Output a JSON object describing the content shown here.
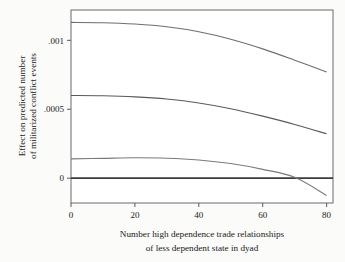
{
  "chart_data": {
    "type": "line",
    "title": "",
    "subtitle": "",
    "xlabel_line1": "Number high dependence trade relationships",
    "xlabel_line2": "of less dependent state in dyad",
    "ylabel_line1": "Effect on predicted number",
    "ylabel_line2": "of militarized conflict events",
    "xlim": [
      0,
      82
    ],
    "ylim": [
      -0.00018,
      0.00122
    ],
    "grid": false,
    "legend": false,
    "legend_position": "none",
    "xticks": [
      0,
      20,
      40,
      60,
      80
    ],
    "xticklabels": [
      "0",
      "20",
      "40",
      "60",
      "80"
    ],
    "yticks": [
      0,
      0.0005,
      0.001
    ],
    "yticklabels": [
      "0",
      ".0005",
      ".001"
    ],
    "reference_lines": [
      {
        "name": "zero-line",
        "orientation": "horizontal",
        "value": 0,
        "color": "#3b3b3b",
        "width": 1.8
      }
    ],
    "x": [
      0,
      10,
      20,
      30,
      40,
      50,
      60,
      70,
      80
    ],
    "series": [
      {
        "name": "upper-curve",
        "color": "#6e6e6e",
        "values": [
          0.00113,
          0.001128,
          0.001118,
          0.001098,
          0.001062,
          0.001008,
          0.000938,
          0.000856,
          0.00077
        ]
      },
      {
        "name": "middle-curve",
        "color": "#5a5a5a",
        "values": [
          0.0006,
          0.000598,
          0.00059,
          0.000574,
          0.000546,
          0.000504,
          0.00045,
          0.00039,
          0.000322
        ]
      },
      {
        "name": "lower-curve",
        "color": "#7a7a7a",
        "values": [
          0.00014,
          0.000144,
          0.000148,
          0.000145,
          0.000132,
          0.000106,
          6.4e-05,
          6e-06,
          -0.000125
        ]
      }
    ],
    "annotations": [
      {
        "name": "zero-crossing",
        "x": 68,
        "y": 0
      }
    ],
    "colors": {
      "plot_background": "#ffffff",
      "figure_background": "#fbfbfa",
      "axis": "#5b5b5b",
      "text": "#1a1a1a"
    }
  }
}
